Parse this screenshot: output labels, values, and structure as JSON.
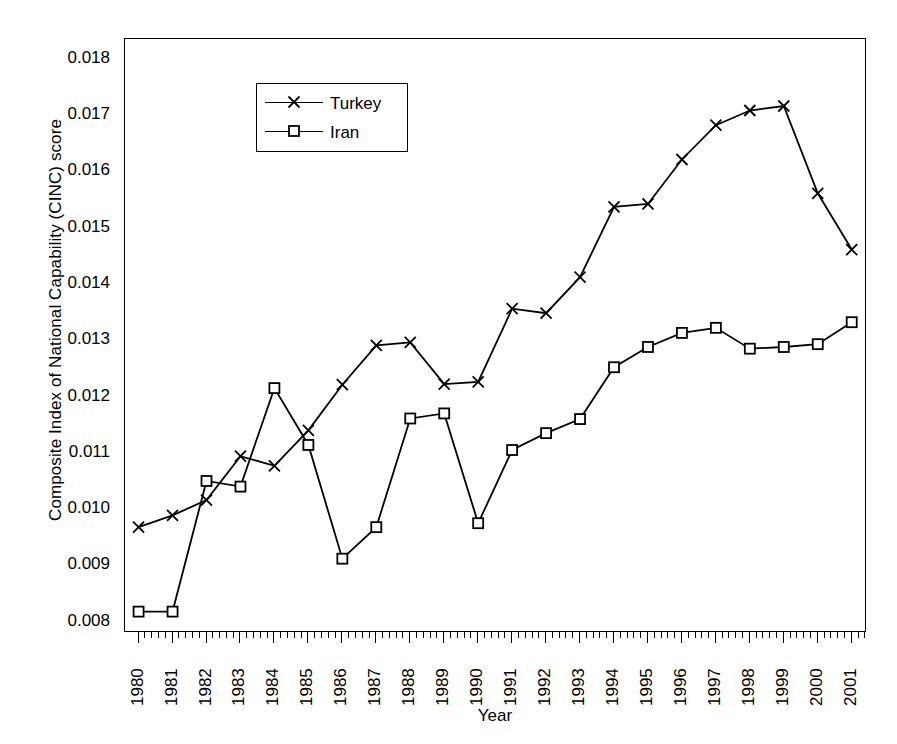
{
  "figure": {
    "top_caption_fragment": "partially cropped italic caption",
    "background_color": "#ffffff",
    "line_color": "#000000"
  },
  "axes": {
    "ylabel": "Composite Index of National Capability (CINC) score",
    "xlabel": "Year",
    "ytick_labels": [
      "0.018",
      "0.017",
      "0.016",
      "0.015",
      "0.014",
      "0.013",
      "0.012",
      "0.011",
      "0.010",
      "0.009",
      "0.008"
    ],
    "ylim": [
      0.0078,
      0.01835
    ],
    "xtick_labels": [
      "1980",
      "1981",
      "1982",
      "1983",
      "1984",
      "1985",
      "1986",
      "1987",
      "1988",
      "1989",
      "1990",
      "1991",
      "1992",
      "1993",
      "1994",
      "1995",
      "1996",
      "1997",
      "1998",
      "1999",
      "2000",
      "2001"
    ]
  },
  "legend": {
    "position": "top-left",
    "entries": [
      {
        "label": "Turkey",
        "marker": "cross-marker"
      },
      {
        "label": "Iran",
        "marker": "square-marker"
      }
    ]
  },
  "chart_data": {
    "type": "line",
    "title": "",
    "subtitle": "",
    "xlabel": "Year",
    "ylabel": "Composite Index of National Capability (CINC) score",
    "x": [
      1980,
      1981,
      1982,
      1983,
      1984,
      1985,
      1986,
      1987,
      1988,
      1989,
      1990,
      1991,
      1992,
      1993,
      1994,
      1995,
      1996,
      1997,
      1998,
      1999,
      2000,
      2001
    ],
    "categories": [
      "1980",
      "1981",
      "1982",
      "1983",
      "1984",
      "1985",
      "1986",
      "1987",
      "1988",
      "1989",
      "1990",
      "1991",
      "1992",
      "1993",
      "1994",
      "1995",
      "1996",
      "1997",
      "1998",
      "1999",
      "2000",
      "2001"
    ],
    "series": [
      {
        "name": "Turkey",
        "marker": "x",
        "color": "#000000",
        "values": [
          0.00968,
          0.00989,
          0.01016,
          0.01094,
          0.01077,
          0.0114,
          0.01221,
          0.01291,
          0.01296,
          0.01222,
          0.01226,
          0.01356,
          0.01348,
          0.01412,
          0.01537,
          0.01542,
          0.01621,
          0.01682,
          0.01708,
          0.01716,
          0.01561,
          0.01461
        ]
      },
      {
        "name": "Iran",
        "marker": "square",
        "color": "#000000",
        "values": [
          0.00818,
          0.00818,
          0.0105,
          0.0104,
          0.01215,
          0.01114,
          0.00912,
          0.00968,
          0.01161,
          0.0117,
          0.00975,
          0.01105,
          0.01135,
          0.0116,
          0.01252,
          0.01288,
          0.01313,
          0.01322,
          0.01285,
          0.01288,
          0.01293,
          0.01332
        ]
      }
    ],
    "ylim": [
      0.0078,
      0.01835
    ],
    "xlim": [
      1979.6,
      2001.45
    ],
    "grid": false,
    "legend_position": "upper left"
  }
}
